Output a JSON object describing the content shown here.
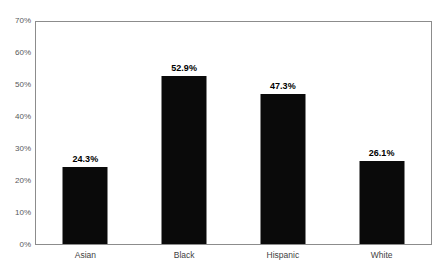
{
  "chart_data": {
    "type": "bar",
    "title": "",
    "subtitle": "",
    "xlabel": "",
    "ylabel": "",
    "categories": [
      "Asian",
      "Black",
      "Hispanic",
      "White"
    ],
    "values": [
      24.3,
      52.9,
      47.3,
      26.1
    ],
    "value_labels": [
      "24.3%",
      "52.9%",
      "47.3%",
      "26.1%"
    ],
    "ylim": [
      0,
      70
    ],
    "ytick_values": [
      0,
      10,
      20,
      30,
      40,
      50,
      60,
      70
    ],
    "ytick_labels": [
      "0%",
      "10%",
      "20%",
      "30%",
      "40%",
      "50%",
      "60%",
      "70%"
    ],
    "grid": false,
    "legend": false,
    "legend_position": "none",
    "bar_color": "#0a0a0a",
    "axis_color": "#8c8c8c",
    "tick_label_color": "#58595b",
    "category_label_color": "#3f3f3f",
    "data_label_color": "#000000",
    "background_color": "#ffffff"
  }
}
